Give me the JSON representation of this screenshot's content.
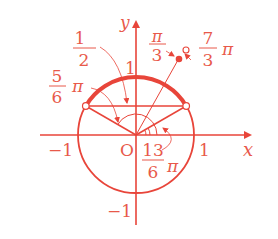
{
  "colors": {
    "primary": "#e8453a",
    "light": "#f08878",
    "text": "#e8594a"
  },
  "axes": {
    "x_label": "x",
    "y_label": "y",
    "origin_label": "O",
    "x_pos_tick": "1",
    "x_neg_tick": "−1",
    "y_pos_tick": "1",
    "y_neg_tick": "−1"
  },
  "labels": {
    "half": {
      "num": "1",
      "den": "2"
    },
    "five_sixths_pi": {
      "num": "5",
      "den": "6",
      "suffix": "π"
    },
    "pi_over_3": {
      "num": "π",
      "den": "3"
    },
    "seven_thirds_pi": {
      "num": "7",
      "den": "3",
      "suffix": "π"
    },
    "thirteen_sixths_pi": {
      "num": "13",
      "den": "6",
      "suffix": "π"
    }
  },
  "diagram": {
    "type": "unit-circle",
    "highlighted_arc": {
      "from_angle": "π/6",
      "to_angle": "5π/6"
    },
    "open_points": [
      "angle π/6 on circle",
      "angle 5π/6 on circle",
      "angle 7π/3 marker"
    ],
    "filled_points": [
      "angle π/3 marker"
    ],
    "horizontal_line_y": "1/2"
  }
}
